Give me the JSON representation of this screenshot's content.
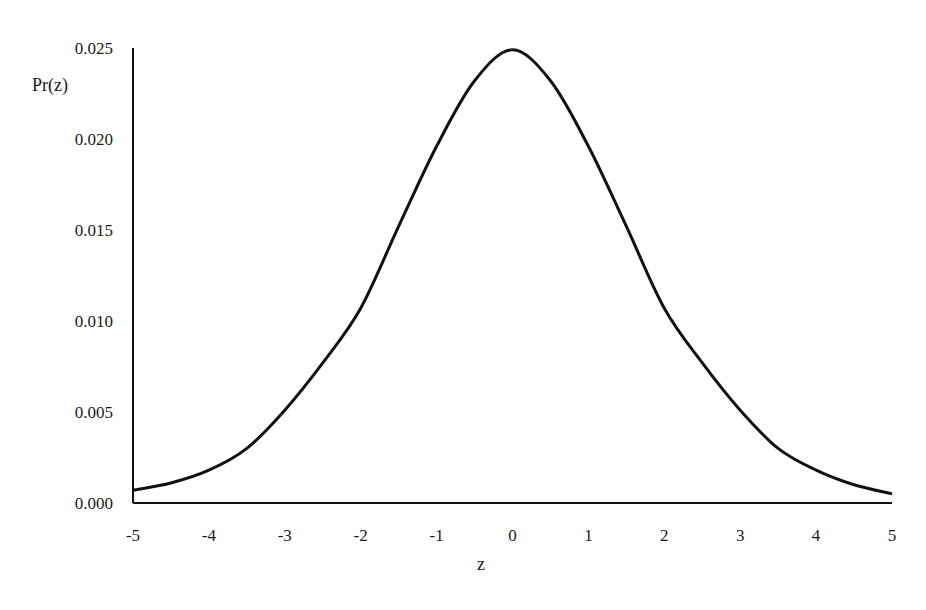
{
  "chart_data": {
    "type": "line",
    "title": "",
    "xlabel": "z",
    "ylabel": "Pr(z)",
    "xlim": [
      -5,
      5
    ],
    "ylim": [
      0.0,
      0.025
    ],
    "grid": false,
    "legend": null,
    "x_ticks": [
      "-5",
      "-4",
      "-3",
      "-2",
      "-1",
      "0",
      "1",
      "2",
      "3",
      "4",
      "5"
    ],
    "y_ticks": [
      "0.000",
      "0.005",
      "0.010",
      "0.015",
      "0.020",
      "0.025"
    ],
    "series": [
      {
        "name": "Pr(z)",
        "color": "#111111",
        "x": [
          -5,
          -4.5,
          -4,
          -3.5,
          -3,
          -2.5,
          -2,
          -1.5,
          -1,
          -0.5,
          0,
          0.5,
          1,
          1.5,
          2,
          2.5,
          3,
          3.5,
          4,
          4.5,
          5
        ],
        "y": [
          0.0007,
          0.0011,
          0.0018,
          0.003,
          0.0051,
          0.0077,
          0.0107,
          0.0152,
          0.0196,
          0.0232,
          0.0249,
          0.0232,
          0.0196,
          0.0152,
          0.0107,
          0.0077,
          0.0051,
          0.003,
          0.0018,
          0.001,
          0.0005
        ]
      }
    ]
  }
}
